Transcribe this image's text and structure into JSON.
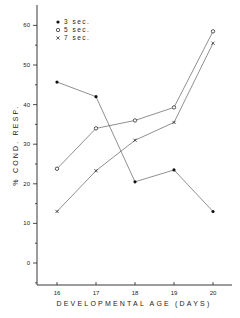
{
  "chart_data": {
    "type": "line",
    "title": "",
    "xlabel": "DEVELOPMENTAL AGE (DAYS)",
    "ylabel": "% COND. RESP.",
    "x": [
      16,
      17,
      18,
      19,
      20
    ],
    "xticks": [
      "16",
      "17",
      "18",
      "19",
      "20"
    ],
    "yticks": [
      "0",
      "10",
      "20",
      "30",
      "40",
      "50",
      "60"
    ],
    "ylim": [
      -5,
      65
    ],
    "grid": false,
    "legend_position": "upper-left",
    "series": [
      {
        "name": "3 sec.",
        "marker": "filled-circle",
        "values": [
          45.7,
          42.0,
          20.5,
          23.5,
          13.0
        ]
      },
      {
        "name": "5 sec.",
        "marker": "open-circle",
        "values": [
          23.8,
          34.0,
          36.0,
          39.3,
          58.5
        ]
      },
      {
        "name": "7 sec.",
        "marker": "x",
        "values": [
          13.0,
          23.3,
          31.0,
          35.5,
          55.5
        ]
      }
    ]
  },
  "legend": {
    "items": [
      {
        "label": "3 sec."
      },
      {
        "label": "5 sec."
      },
      {
        "label": "7 sec."
      }
    ]
  },
  "axes": {
    "xlabel": "DEVELOPMENTAL  AGE  (DAYS)",
    "ylabel": "% COND.  RESP."
  }
}
